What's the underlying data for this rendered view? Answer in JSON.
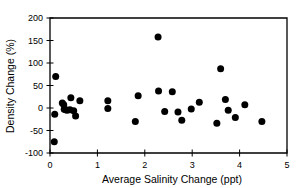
{
  "chart_data": {
    "type": "scatter",
    "title": "",
    "xlabel": "Average Salinity Change (ppt)",
    "ylabel": "Density Change (%)",
    "xlim": [
      0,
      5
    ],
    "ylim": [
      -100,
      200
    ],
    "xticks": [
      0,
      1,
      2,
      3,
      4,
      5
    ],
    "yticks": [
      -100,
      -50,
      0,
      50,
      100,
      150,
      200
    ],
    "xtick_labels": [
      "0",
      "1",
      "2",
      "3",
      "4",
      "5"
    ],
    "ytick_labels": [
      "-100",
      "-50",
      "0",
      "50",
      "100",
      "150",
      "200"
    ],
    "grid": false,
    "legend": null,
    "marker": "filled-circle",
    "marker_color": "#000000",
    "marker_size": 4.6,
    "series": [
      {
        "name": "Density vs Salinity Change",
        "points": [
          {
            "x": 0.09,
            "y": -75
          },
          {
            "x": 0.12,
            "y": 70
          },
          {
            "x": 0.1,
            "y": -14
          },
          {
            "x": 0.26,
            "y": 11
          },
          {
            "x": 0.29,
            "y": 7
          },
          {
            "x": 0.3,
            "y": -3
          },
          {
            "x": 0.33,
            "y": -4
          },
          {
            "x": 0.36,
            "y": -5
          },
          {
            "x": 0.42,
            "y": -4
          },
          {
            "x": 0.44,
            "y": 23
          },
          {
            "x": 0.5,
            "y": -6
          },
          {
            "x": 0.54,
            "y": -18
          },
          {
            "x": 0.63,
            "y": 16
          },
          {
            "x": 1.22,
            "y": 16
          },
          {
            "x": 1.22,
            "y": -1
          },
          {
            "x": 1.8,
            "y": -30
          },
          {
            "x": 1.86,
            "y": 27
          },
          {
            "x": 2.28,
            "y": 158
          },
          {
            "x": 2.29,
            "y": 38
          },
          {
            "x": 2.42,
            "y": -8
          },
          {
            "x": 2.58,
            "y": 36
          },
          {
            "x": 2.7,
            "y": -9
          },
          {
            "x": 2.78,
            "y": -27
          },
          {
            "x": 2.98,
            "y": -2
          },
          {
            "x": 3.15,
            "y": 13
          },
          {
            "x": 3.52,
            "y": -34
          },
          {
            "x": 3.6,
            "y": 87
          },
          {
            "x": 3.7,
            "y": 19
          },
          {
            "x": 3.76,
            "y": -5
          },
          {
            "x": 3.91,
            "y": -21
          },
          {
            "x": 4.11,
            "y": 7
          },
          {
            "x": 4.47,
            "y": -30
          }
        ]
      }
    ]
  },
  "layout": {
    "plot_left": 50,
    "plot_right": 287,
    "plot_top": 18,
    "plot_bottom": 153
  }
}
